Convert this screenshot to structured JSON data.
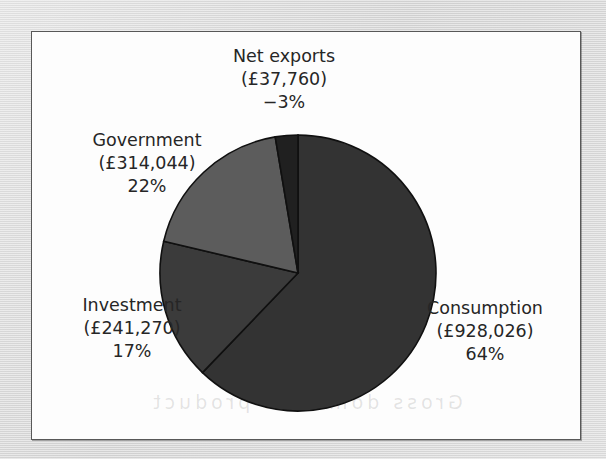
{
  "figure": {
    "background_color": "#fdfdfd",
    "frame_color": "#585858",
    "margin_color": "#d9d9d9",
    "scan_ghost_text": "Gross domestic product"
  },
  "chart_data": {
    "type": "pie",
    "title": "",
    "subtitle": "",
    "xlabel": "",
    "ylabel": "",
    "legend_position": "none",
    "grid": false,
    "currency_symbol": "£",
    "categories": [
      "Consumption",
      "Investment",
      "Government",
      "Net exports"
    ],
    "values": [
      928026,
      241270,
      314044,
      -37760
    ],
    "percentages": [
      64,
      17,
      22,
      -3
    ],
    "start_angle_deg": 0,
    "direction": "clockwise",
    "center": {
      "x": 266,
      "y": 241
    },
    "radius": 138,
    "slices": [
      {
        "name": "Consumption",
        "value": 928026,
        "value_label": "(£928,026)",
        "percent": 64,
        "percent_label": "64%",
        "color": "#333333",
        "start_angle_deg": 0,
        "sweep_deg": 223.8
      },
      {
        "name": "Investment",
        "value": 241270,
        "value_label": "(£241,270)",
        "percent": 17,
        "percent_label": "17%",
        "color": "#3b3b3b",
        "start_angle_deg": 223.8,
        "sweep_deg": 59.5
      },
      {
        "name": "Government",
        "value": 314044,
        "value_label": "(£314,044)",
        "percent": 22,
        "percent_label": "22%",
        "color": "#5c5c5c",
        "start_angle_deg": 283.3,
        "sweep_deg": 67.2
      },
      {
        "name": "Net exports",
        "value": -37760,
        "value_label": "(£37,760)",
        "percent": -3,
        "percent_label": "−3%",
        "color": "#202020",
        "start_angle_deg": 350.5,
        "sweep_deg": 9.5
      }
    ],
    "slice_edge_color": "#101010",
    "label_text_color": "#262626"
  },
  "labels": {
    "net_exports": {
      "name": "Net exports",
      "value": "(£37,760)",
      "share": "−3%"
    },
    "government": {
      "name": "Government",
      "value": "(£314,044)",
      "share": "22%"
    },
    "investment": {
      "name": "Investment",
      "value": "(£241,270)",
      "share": "17%"
    },
    "consumption": {
      "name": "Consumption",
      "value": "(£928,026)",
      "share": "64%"
    }
  }
}
